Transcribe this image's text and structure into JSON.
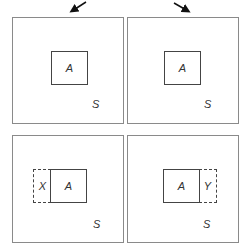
{
  "diagram": {
    "arrows": [
      {
        "direction": "down-left",
        "from": [
          86,
          2
        ],
        "to": [
          70,
          12
        ]
      },
      {
        "direction": "down-right",
        "from": [
          174,
          3
        ],
        "to": [
          190,
          12
        ]
      }
    ],
    "panels": [
      {
        "id": "top-left",
        "set_label": "S",
        "boxes": [
          {
            "label": "A",
            "style": "solid"
          }
        ]
      },
      {
        "id": "top-right",
        "set_label": "S",
        "boxes": [
          {
            "label": "A",
            "style": "solid"
          }
        ]
      },
      {
        "id": "bottom-left",
        "set_label": "S",
        "boxes": [
          {
            "label": "X",
            "style": "dashed"
          },
          {
            "label": "A",
            "style": "solid"
          }
        ]
      },
      {
        "id": "bottom-right",
        "set_label": "S",
        "boxes": [
          {
            "label": "A",
            "style": "solid"
          },
          {
            "label": "Y",
            "style": "dashed"
          }
        ]
      }
    ],
    "colors": {
      "line": "#444444",
      "frame": "#8a8a8a",
      "background": "#ffffff"
    }
  }
}
